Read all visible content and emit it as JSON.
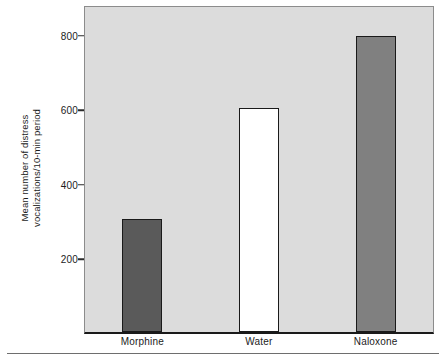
{
  "chart_data": {
    "type": "bar",
    "title": "",
    "subtitle": "",
    "xlabel": "",
    "ylabel": "Mean number of distress vocalizations/10-min period",
    "ylabel_line1": "Mean number of distress",
    "ylabel_line2": "vocalizations/10-min period",
    "categories": [
      "Morphine",
      "Water",
      "Naloxone"
    ],
    "values": [
      302,
      600,
      795
    ],
    "series": [
      {
        "name": "Mean number of distress vocalizations/10-min period",
        "values": [
          302,
          600,
          795
        ]
      }
    ],
    "ylim": [
      0,
      880
    ],
    "yticks": [
      200,
      400,
      600,
      800
    ],
    "ytick_labels": [
      "200",
      "400",
      "600",
      "800"
    ],
    "grid": false,
    "legend": "none",
    "bar_colors": [
      "#5a5a5a",
      "#ffffff",
      "#808080"
    ],
    "bar_edge_color": "#1a1a1a",
    "plot_background": "#dcdcdc",
    "axis_color": "#1a1a1a",
    "figure_background": "#ffffff"
  }
}
